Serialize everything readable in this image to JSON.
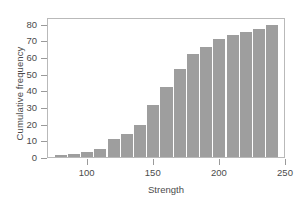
{
  "chart_data": {
    "type": "bar",
    "title": "",
    "xlabel": "Strength",
    "ylabel": "Cumulative frequency",
    "xlim": [
      70,
      250
    ],
    "ylim": [
      0,
      84
    ],
    "grid": false,
    "legend": null,
    "bar_color": "#9e9e9e",
    "axis_color": "#b9b9b9",
    "bin_width": 10,
    "xticks": [
      100,
      150,
      200,
      250
    ],
    "xtick_labels": [
      "100",
      "150",
      "200",
      "250"
    ],
    "yticks": [
      0,
      10,
      20,
      30,
      40,
      50,
      60,
      70,
      80
    ],
    "ytick_labels": [
      "0",
      "10",
      "20",
      "30",
      "40",
      "50",
      "60",
      "70",
      "80"
    ],
    "bins": [
      {
        "left": 75,
        "right": 85,
        "value": 1
      },
      {
        "left": 85,
        "right": 95,
        "value": 2
      },
      {
        "left": 95,
        "right": 105,
        "value": 3
      },
      {
        "left": 105,
        "right": 115,
        "value": 5
      },
      {
        "left": 115,
        "right": 125,
        "value": 11
      },
      {
        "left": 125,
        "right": 135,
        "value": 14
      },
      {
        "left": 135,
        "right": 145,
        "value": 19
      },
      {
        "left": 145,
        "right": 155,
        "value": 31
      },
      {
        "left": 155,
        "right": 165,
        "value": 42
      },
      {
        "left": 165,
        "right": 175,
        "value": 53
      },
      {
        "left": 175,
        "right": 185,
        "value": 62
      },
      {
        "left": 185,
        "right": 195,
        "value": 66
      },
      {
        "left": 195,
        "right": 205,
        "value": 71
      },
      {
        "left": 205,
        "right": 215,
        "value": 73
      },
      {
        "left": 215,
        "right": 225,
        "value": 75
      },
      {
        "left": 225,
        "right": 235,
        "value": 77
      },
      {
        "left": 235,
        "right": 245,
        "value": 79
      }
    ],
    "categories": [
      "75",
      "85",
      "95",
      "105",
      "115",
      "125",
      "135",
      "145",
      "155",
      "165",
      "175",
      "185",
      "195",
      "205",
      "215",
      "225",
      "235"
    ],
    "values": [
      1,
      2,
      3,
      5,
      11,
      14,
      19,
      31,
      42,
      53,
      62,
      66,
      71,
      73,
      75,
      77,
      79
    ]
  }
}
